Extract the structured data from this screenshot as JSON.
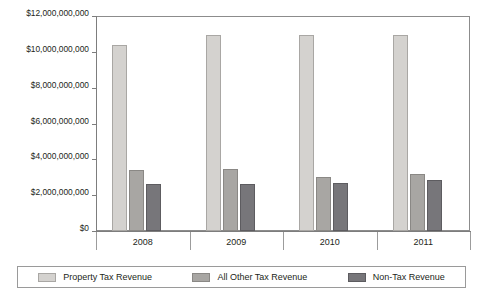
{
  "chart_data": {
    "type": "bar",
    "title": "",
    "subtitle": "",
    "xlabel": "",
    "ylabel": "",
    "categories": [
      "2008",
      "2009",
      "2010",
      "2011"
    ],
    "series": [
      {
        "name": "Property Tax Revenue",
        "color": "#d4d2cf",
        "values": [
          10400000000,
          10950000000,
          10950000000,
          10950000000
        ]
      },
      {
        "name": "All Other Tax Revenue",
        "color": "#a8a6a3",
        "values": [
          3400000000,
          3450000000,
          3000000000,
          3200000000
        ]
      },
      {
        "name": "Non-Tax Revenue",
        "color": "#77767a",
        "values": [
          2650000000,
          2650000000,
          2700000000,
          2850000000
        ]
      }
    ],
    "ylim": [
      0,
      12000000000
    ],
    "ytick_values": [
      0,
      2000000000,
      4000000000,
      6000000000,
      8000000000,
      10000000000,
      12000000000
    ],
    "ytick_labels": [
      "$0",
      "$2,000,000,000",
      "$4,000,000,000",
      "$6,000,000,000",
      "$8,000,000,000",
      "$10,000,000,000",
      "$12,000,000,000"
    ],
    "grid": false,
    "legend_position": "bottom"
  },
  "legend": {
    "items": [
      {
        "label": "Property Tax Revenue"
      },
      {
        "label": "All Other Tax Revenue"
      },
      {
        "label": "Non-Tax Revenue"
      }
    ]
  }
}
